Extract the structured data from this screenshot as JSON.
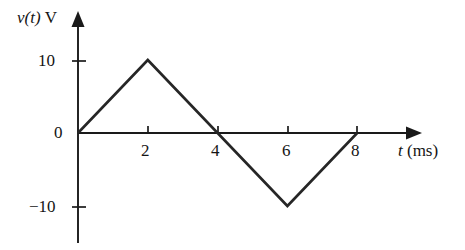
{
  "figure": {
    "background_color": "#ffffff",
    "ink_color": "#262626",
    "axis_color": "#1a1a1a"
  },
  "axes": {
    "y_caption_variable": "v(t)",
    "y_caption_unit": "V",
    "x_caption_variable": "t",
    "x_caption_unit": "(ms)"
  },
  "ticks": {
    "y": [
      {
        "label": "10"
      },
      {
        "label": "0"
      },
      {
        "label": "−10"
      }
    ],
    "x": [
      {
        "label": "2"
      },
      {
        "label": "4"
      },
      {
        "label": "6"
      },
      {
        "label": "8"
      }
    ]
  },
  "chart_data": {
    "type": "line",
    "title": "",
    "xlabel": "t (ms)",
    "ylabel": "v(t) V",
    "x": [
      0,
      2,
      4,
      6,
      8
    ],
    "values": [
      0,
      10,
      0,
      -10,
      0
    ],
    "series": [
      {
        "name": "v(t)",
        "x": [
          0,
          2,
          4,
          6,
          8
        ],
        "values": [
          0,
          10,
          0,
          -10,
          0
        ]
      }
    ],
    "xlim": [
      0,
      9.8
    ],
    "ylim": [
      -15,
      16.6
    ],
    "xticks": [
      2,
      4,
      6,
      8
    ],
    "yticks": [
      10,
      0,
      -10
    ],
    "xtick_labels": [
      "2",
      "4",
      "6",
      "8"
    ],
    "ytick_labels": [
      "10",
      "0",
      "−10"
    ],
    "grid": false,
    "legend": null,
    "line_color": "#262626",
    "line_width": 2.6,
    "annotations": []
  }
}
